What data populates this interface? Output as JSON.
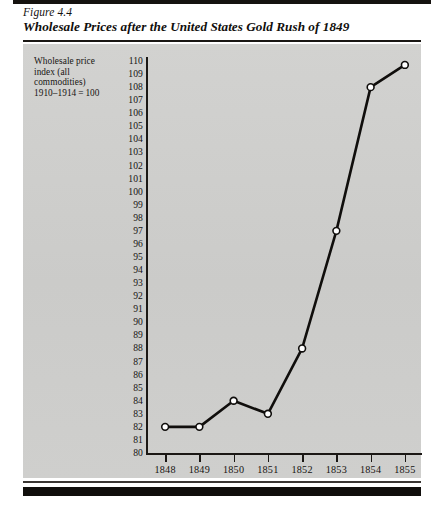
{
  "figure": {
    "number": "Figure 4.4",
    "title": "Wholesale Prices after the United States Gold Rush of 1849"
  },
  "axis_caption": {
    "line1": "Wholesale price",
    "line2": "index (all",
    "line3": "commodities)",
    "line4": "1910–1914 = 100"
  },
  "chart_data": {
    "type": "line",
    "title": "Wholesale Prices after the United States Gold Rush of 1849",
    "subtitle": "Figure 4.4",
    "xlabel": "",
    "ylabel": "Wholesale price index (all commodities) 1910-1914=100",
    "categories": [
      "1848",
      "1849",
      "1850",
      "1851",
      "1852",
      "1853",
      "1854",
      "1855"
    ],
    "values": [
      82,
      82,
      84,
      83,
      88,
      97,
      108,
      109.7
    ],
    "ylim": [
      80,
      110
    ],
    "ytick_step": 1,
    "yticks": [
      110,
      109,
      108,
      107,
      106,
      105,
      104,
      103,
      102,
      101,
      100,
      99,
      98,
      97,
      96,
      95,
      94,
      93,
      92,
      91,
      90,
      89,
      88,
      87,
      86,
      85,
      84,
      83,
      82,
      81,
      80
    ],
    "grid": false,
    "legend": "none",
    "marker": "open-circle",
    "line_color": "#100e0c",
    "marker_fill": "#ffffff",
    "panel_color": "#cfcfcd"
  }
}
